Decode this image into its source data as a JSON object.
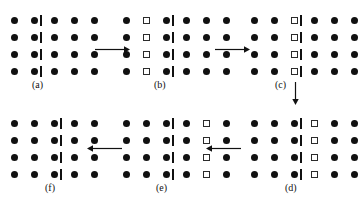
{
  "figure": {
    "title": "",
    "background_color": "#ffffff",
    "atom_colors": {
      "filled": "#111111",
      "open_fill": "#ffffff",
      "open_stroke": "#2b2b2b",
      "marker": "#111111",
      "arrow": "#111111"
    },
    "legend": {
      "filled_circle": "filled-circle-atom",
      "open_square": "open-square-atom",
      "vertical_bar": "extra-half-plane-marker"
    },
    "grid": {
      "rows": 4,
      "col_spacing_px": 20,
      "row_spacing_px": 17,
      "atom_size_px": 7
    },
    "panels": [
      {
        "id": "a",
        "caption": "(a)",
        "x": 11,
        "y": 17,
        "cols": 5,
        "rows": 4,
        "open_column": 0,
        "marker_after_col": 2,
        "caption_x": 32,
        "caption_y": 80
      },
      {
        "id": "b",
        "caption": "(b)",
        "x": 123,
        "y": 17,
        "cols": 6,
        "rows": 4,
        "open_column": 2,
        "marker_after_col": 3,
        "caption_x": 154,
        "caption_y": 80
      },
      {
        "id": "c",
        "caption": "(c)",
        "x": 251,
        "y": 17,
        "cols": 6,
        "rows": 4,
        "open_column": 3,
        "marker_after_col": 3,
        "caption_x": 275,
        "caption_y": 80
      },
      {
        "id": "d",
        "caption": "(d)",
        "x": 251,
        "y": 120,
        "cols": 6,
        "rows": 4,
        "open_column": 4,
        "marker_after_col": 3,
        "caption_x": 285,
        "caption_y": 183
      },
      {
        "id": "e",
        "caption": "(e)",
        "x": 123,
        "y": 120,
        "cols": 6,
        "rows": 4,
        "open_column": 5,
        "marker_after_col": 3,
        "caption_x": 156,
        "caption_y": 183
      },
      {
        "id": "f",
        "caption": "(f)",
        "x": 11,
        "y": 120,
        "cols": 5,
        "rows": 4,
        "open_column": 0,
        "marker_after_col": 3,
        "caption_x": 45,
        "caption_y": 183
      }
    ],
    "arrows": [
      {
        "id": "a-to-b",
        "direction": "right",
        "x": 95,
        "y": 45,
        "length": 35
      },
      {
        "id": "b-to-c",
        "direction": "right",
        "x": 215,
        "y": 45,
        "length": 35
      },
      {
        "id": "c-to-d",
        "direction": "down",
        "x": 291,
        "y": 82,
        "length": 23
      },
      {
        "id": "d-to-e",
        "direction": "left",
        "x": 206,
        "y": 144,
        "length": 35
      },
      {
        "id": "e-to-f",
        "direction": "left",
        "x": 87,
        "y": 144,
        "length": 35
      }
    ]
  }
}
